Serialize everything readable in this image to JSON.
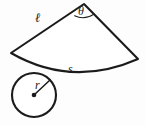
{
  "figure": {
    "kind": "circular-sector-and-circle-geometry-diagram",
    "background_color": "#fdfdfd",
    "stroke_color": "#1b1b1b",
    "labels": {
      "arc_length": "s",
      "radius": "r",
      "slant_side": "ℓ",
      "angle": "θ"
    },
    "geometry": {
      "sector": {
        "apex": [
          84,
          4
        ],
        "left_vertex": [
          11,
          53
        ],
        "right_vertex": [
          138,
          59
        ],
        "arc_sagitta_point": [
          72,
          80
        ]
      },
      "circle": {
        "center": [
          34,
          95
        ],
        "radius": 22,
        "radius_endpoint": [
          50,
          80
        ]
      },
      "angle_arc": {
        "center": [
          84,
          4
        ],
        "radius": 15
      }
    }
  }
}
